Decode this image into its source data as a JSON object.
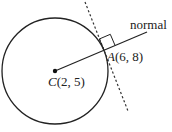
{
  "diagram": {
    "type": "circle-tangent-normal",
    "colors": {
      "stroke": "#222222",
      "background": "#ffffff"
    },
    "circle": {
      "center_label_letter": "C",
      "center_label_coords": "(2, 5)",
      "center_px": [
        55,
        71
      ],
      "radius_px": 53
    },
    "point_a": {
      "label_letter": "A",
      "label_coords": "(6, 8)",
      "px": [
        104,
        50
      ]
    },
    "normal": {
      "label": "normal",
      "style": "solid"
    },
    "tangent": {
      "style": "dashed"
    },
    "right_angle_marker": true
  }
}
